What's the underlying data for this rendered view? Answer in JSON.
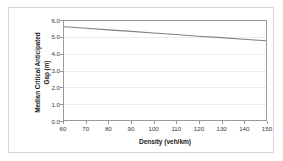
{
  "chart_data": {
    "type": "line",
    "title": "",
    "xlabel": "Density (veh/km)",
    "ylabel_line1": "Median Critical Anticipated",
    "ylabel_line2": "Gap (m)",
    "ylabel": "Median Critical Anticipated Gap (m)",
    "xlim": [
      60,
      150
    ],
    "ylim": [
      0.0,
      6.0
    ],
    "xticks": [
      60,
      70,
      80,
      90,
      100,
      110,
      120,
      130,
      140,
      150
    ],
    "xtick_labels": [
      "60",
      "70",
      "80",
      "90",
      "100",
      "110",
      "120",
      "130",
      "140",
      "150"
    ],
    "yticks": [
      0.0,
      1.0,
      2.0,
      3.0,
      4.0,
      5.0,
      6.0
    ],
    "ytick_labels": [
      "0.0",
      "1.0",
      "2.0",
      "3.0",
      "4.0",
      "5.0",
      "6.0"
    ],
    "grid": "horizontal",
    "legend": "none",
    "series": [
      {
        "name": "Median Critical Anticipated Gap",
        "color": "#808080",
        "x": [
          60,
          70,
          80,
          90,
          100,
          110,
          120,
          130,
          140,
          150
        ],
        "values": [
          5.65,
          5.56,
          5.46,
          5.37,
          5.27,
          5.18,
          5.08,
          4.99,
          4.89,
          4.8
        ]
      }
    ],
    "colors": {
      "line": "#808080",
      "plot_border": "#9a9a9a",
      "gridline": "#ececec",
      "figure_border": "#d6d6d6",
      "background": "#ffffff",
      "tick_label": "#3a3a3a",
      "axis_title": "#1a1a1a"
    }
  }
}
